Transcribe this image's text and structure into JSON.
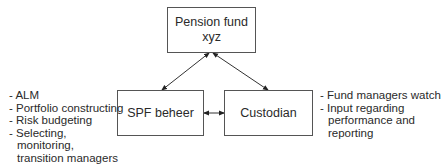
{
  "diagram": {
    "nodes": {
      "top": {
        "line1": "Pension fund",
        "line2": "xyz"
      },
      "left": {
        "label": "SPF beheer"
      },
      "right": {
        "label": "Custodian"
      }
    },
    "edges": [
      {
        "from": "Pension fund xyz",
        "to": "SPF beheer",
        "type": "bidirectional"
      },
      {
        "from": "Pension fund xyz",
        "to": "Custodian",
        "type": "bidirectional"
      },
      {
        "from": "SPF beheer",
        "to": "Custodian",
        "type": "bidirectional"
      }
    ],
    "left_notes": [
      "- ALM",
      "- Portfolio constructing",
      "- Risk budgeting",
      "- Selecting,",
      "monitoring,",
      "transition managers"
    ],
    "right_notes": [
      "- Fund managers watch",
      "- Input regarding",
      "performance and",
      "reporting"
    ],
    "colors": {
      "line": "#333333",
      "box_border": "#555555",
      "text": "#2a2a2a"
    }
  }
}
